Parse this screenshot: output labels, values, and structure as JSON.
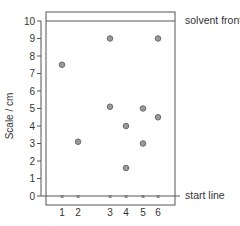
{
  "diagram": {
    "type": "chromatogram",
    "ylabel": "Scale / cm",
    "solvent_front_label": "solvent front",
    "start_line_label": "start line",
    "y_ticks": [
      "0",
      "1",
      "2",
      "3",
      "4",
      "5",
      "6",
      "7",
      "8",
      "9",
      "10"
    ],
    "lanes": [
      "1",
      "2",
      "3",
      "4",
      "5",
      "6"
    ]
  },
  "chart_data": {
    "type": "scatter",
    "title": "",
    "xlabel": "",
    "ylabel": "Scale / cm",
    "ylim": [
      0,
      10
    ],
    "categories": [
      "1",
      "2",
      "3",
      "4",
      "5",
      "6"
    ],
    "annotations": [
      "solvent front (y=10)",
      "start line (y=0)"
    ],
    "grid": false,
    "series": [
      {
        "name": "spots",
        "points": [
          {
            "lane": "1",
            "y": 7.5
          },
          {
            "lane": "2",
            "y": 3.1
          },
          {
            "lane": "3",
            "y": 9.0
          },
          {
            "lane": "3",
            "y": 5.1
          },
          {
            "lane": "4",
            "y": 4.0
          },
          {
            "lane": "4",
            "y": 1.6
          },
          {
            "lane": "5",
            "y": 5.0
          },
          {
            "lane": "5",
            "y": 3.0
          },
          {
            "lane": "6",
            "y": 9.0
          },
          {
            "lane": "6",
            "y": 4.5
          }
        ]
      }
    ]
  }
}
